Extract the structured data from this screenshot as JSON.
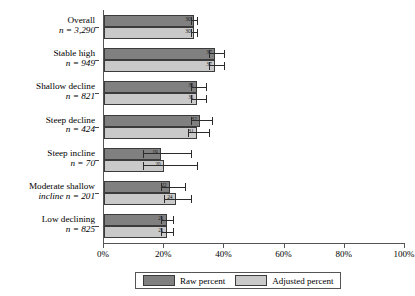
{
  "chart_data": {
    "type": "bar",
    "orientation": "horizontal",
    "title": "",
    "xlabel": "",
    "ylabel": "",
    "xlim": [
      0,
      100
    ],
    "grid": false,
    "legend_position": "bottom",
    "xticks": [
      "0%",
      "20%",
      "40%",
      "60%",
      "80%",
      "100%"
    ],
    "xtick_values": [
      0,
      20,
      40,
      60,
      80,
      100
    ],
    "categories": [
      "Overall",
      "Stable high",
      "Shallow decline",
      "Steep decline",
      "Steep incline",
      "Moderate shallow incline",
      "Low declining"
    ],
    "category_n": [
      "n = 3,290",
      "n = 949",
      "n = 821",
      "n = 424",
      "n = 70",
      "n = 201",
      "n = 825"
    ],
    "series": [
      {
        "name": "Raw percent",
        "color": "#808080",
        "values": [
          30,
          37,
          31,
          32,
          19,
          22,
          21
        ],
        "value_labels": [
          "30",
          "37",
          "31",
          "32",
          "19",
          "22",
          "21"
        ],
        "err_low": [
          29,
          35,
          29,
          29,
          13,
          19,
          19
        ],
        "err_high": [
          31,
          40,
          34,
          36,
          29,
          27,
          23
        ]
      },
      {
        "name": "Adjusted percent",
        "color": "#c9c9c9",
        "values": [
          30,
          37,
          31,
          31,
          20,
          24,
          21
        ],
        "value_labels": [
          "30",
          "37",
          "31",
          "31",
          "20",
          "24",
          "21"
        ],
        "err_low": [
          29,
          35,
          29,
          28,
          13,
          20,
          19
        ],
        "err_high": [
          31,
          40,
          34,
          35,
          31,
          29,
          23
        ]
      }
    ]
  },
  "legend": {
    "items": [
      {
        "label": "Raw percent",
        "color": "#808080"
      },
      {
        "label": "Adjusted percent",
        "color": "#c9c9c9"
      }
    ]
  }
}
